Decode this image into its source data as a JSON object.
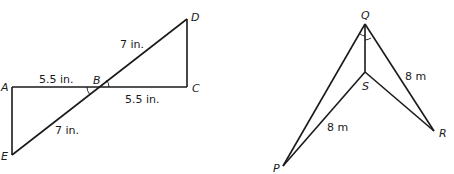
{
  "figure_left": {
    "points": {
      "A": "A",
      "B": "B",
      "C": "C",
      "D": "D",
      "E": "E"
    },
    "labels": {
      "AB": "5.5 in.",
      "BC": "5.5 in.",
      "BD": "7 in.",
      "BE": "7 in."
    }
  },
  "figure_right": {
    "points": {
      "P": "P",
      "Q": "Q",
      "R": "R",
      "S": "S"
    },
    "labels": {
      "QR": "8 m",
      "SP": "8 m"
    }
  }
}
